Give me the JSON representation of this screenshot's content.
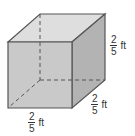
{
  "figure": {
    "type": "cube",
    "colors": {
      "front_face": "#c9c9c9",
      "top_face": "#dedede",
      "side_face": "#b3b3b3",
      "edge": "#555555",
      "hidden_edge": "#555555"
    },
    "labels": {
      "height": {
        "numerator": "2",
        "denominator": "5",
        "unit": "ft"
      },
      "depth": {
        "numerator": "2",
        "denominator": "5",
        "unit": "ft"
      },
      "width": {
        "numerator": "2",
        "denominator": "5",
        "unit": "ft"
      }
    }
  }
}
